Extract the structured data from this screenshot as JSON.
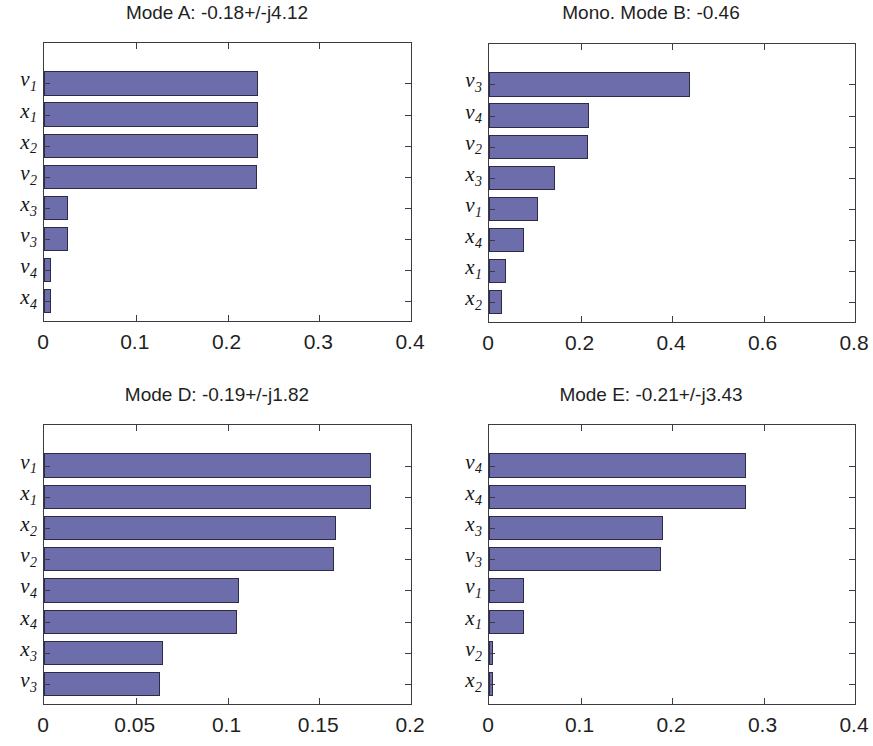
{
  "figure": {
    "width": 868,
    "height": 746,
    "background": "#ffffff",
    "bar_fill_color": "#6e6dab",
    "bar_edge_color": "#2c2c46",
    "axis_color": "#3b3b47"
  },
  "chart_data": [
    {
      "id": "mode-a",
      "type": "bar",
      "orientation": "horizontal",
      "title": "Mode A: -0.18+/-j4.12",
      "xlabel": "",
      "ylabel": "",
      "xlim": [
        0,
        0.4
      ],
      "xticks": [
        0,
        0.1,
        0.2,
        0.3,
        0.4
      ],
      "xtick_labels": [
        "0",
        "0.1",
        "0.2",
        "0.3",
        "0.4"
      ],
      "grid": false,
      "legend": "none",
      "categories": [
        "v1",
        "x1",
        "x2",
        "v2",
        "x3",
        "v3",
        "v4",
        "x4"
      ],
      "category_labels": [
        {
          "base": "v",
          "sub": "1"
        },
        {
          "base": "x",
          "sub": "1"
        },
        {
          "base": "x",
          "sub": "2"
        },
        {
          "base": "v",
          "sub": "2"
        },
        {
          "base": "x",
          "sub": "3"
        },
        {
          "base": "v",
          "sub": "3"
        },
        {
          "base": "v",
          "sub": "4"
        },
        {
          "base": "x",
          "sub": "4"
        }
      ],
      "values": [
        0.233,
        0.233,
        0.233,
        0.232,
        0.026,
        0.026,
        0.008,
        0.008
      ]
    },
    {
      "id": "mode-b",
      "type": "bar",
      "orientation": "horizontal",
      "title": "Mono. Mode B: -0.46",
      "xlabel": "",
      "ylabel": "",
      "xlim": [
        0,
        0.8
      ],
      "xticks": [
        0,
        0.2,
        0.4,
        0.6,
        0.8
      ],
      "xtick_labels": [
        "0",
        "0.2",
        "0.4",
        "0.6",
        "0.8"
      ],
      "grid": false,
      "legend": "none",
      "categories": [
        "v3",
        "v4",
        "v2",
        "x3",
        "v1",
        "x4",
        "x1",
        "x2"
      ],
      "category_labels": [
        {
          "base": "v",
          "sub": "3"
        },
        {
          "base": "v",
          "sub": "4"
        },
        {
          "base": "v",
          "sub": "2"
        },
        {
          "base": "x",
          "sub": "3"
        },
        {
          "base": "v",
          "sub": "1"
        },
        {
          "base": "x",
          "sub": "4"
        },
        {
          "base": "x",
          "sub": "1"
        },
        {
          "base": "x",
          "sub": "2"
        }
      ],
      "values": [
        0.44,
        0.218,
        0.216,
        0.145,
        0.108,
        0.077,
        0.037,
        0.028
      ]
    },
    {
      "id": "mode-d",
      "type": "bar",
      "orientation": "horizontal",
      "title": "Mode D: -0.19+/-j1.82",
      "xlabel": "",
      "ylabel": "",
      "xlim": [
        0,
        0.2
      ],
      "xticks": [
        0,
        0.05,
        0.1,
        0.15,
        0.2
      ],
      "xtick_labels": [
        "0",
        "0.05",
        "0.1",
        "0.15",
        "0.2"
      ],
      "grid": false,
      "legend": "none",
      "categories": [
        "v1",
        "x1",
        "x2",
        "v2",
        "v4",
        "x4",
        "x3",
        "v3"
      ],
      "category_labels": [
        {
          "base": "v",
          "sub": "1"
        },
        {
          "base": "x",
          "sub": "1"
        },
        {
          "base": "x",
          "sub": "2"
        },
        {
          "base": "v",
          "sub": "2"
        },
        {
          "base": "v",
          "sub": "4"
        },
        {
          "base": "x",
          "sub": "4"
        },
        {
          "base": "x",
          "sub": "3"
        },
        {
          "base": "v",
          "sub": "3"
        }
      ],
      "values": [
        0.178,
        0.178,
        0.159,
        0.158,
        0.106,
        0.105,
        0.065,
        0.063
      ]
    },
    {
      "id": "mode-e",
      "type": "bar",
      "orientation": "horizontal",
      "title": "Mode E: -0.21+/-j3.43",
      "xlabel": "",
      "ylabel": "",
      "xlim": [
        0,
        0.4
      ],
      "xticks": [
        0,
        0.1,
        0.2,
        0.3,
        0.4
      ],
      "xtick_labels": [
        "0",
        "0.1",
        "0.2",
        "0.3",
        "0.4"
      ],
      "grid": false,
      "legend": "none",
      "categories": [
        "v4",
        "x4",
        "x3",
        "v3",
        "v1",
        "x1",
        "v2",
        "x2"
      ],
      "category_labels": [
        {
          "base": "v",
          "sub": "4"
        },
        {
          "base": "x",
          "sub": "4"
        },
        {
          "base": "x",
          "sub": "3"
        },
        {
          "base": "v",
          "sub": "3"
        },
        {
          "base": "v",
          "sub": "1"
        },
        {
          "base": "x",
          "sub": "1"
        },
        {
          "base": "v",
          "sub": "2"
        },
        {
          "base": "x",
          "sub": "2"
        }
      ],
      "values": [
        0.281,
        0.281,
        0.19,
        0.188,
        0.038,
        0.038,
        0.004,
        0.004
      ]
    }
  ]
}
